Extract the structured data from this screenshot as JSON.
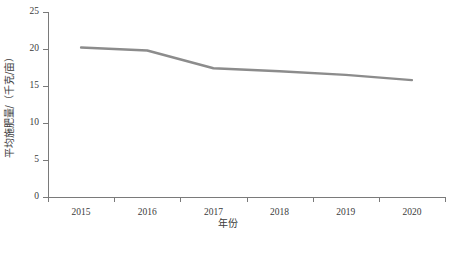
{
  "chart_data": {
    "type": "line",
    "title": "",
    "subtitle": "",
    "xlabel": "年份",
    "ylabel": "平均施肥量/（千克/亩）",
    "categories": [
      "2015",
      "2016",
      "2017",
      "2018",
      "2019",
      "2020"
    ],
    "series": [
      {
        "name": "平均施肥量",
        "color": "#8c8c8c",
        "values": [
          20.2,
          19.8,
          17.4,
          17.0,
          16.5,
          15.8
        ]
      }
    ],
    "x": [
      "2015",
      "2016",
      "2017",
      "2018",
      "2019",
      "2020"
    ],
    "values": [
      20.2,
      19.8,
      17.4,
      17.0,
      16.5,
      15.8
    ],
    "ylim": [
      0,
      25
    ],
    "yticks": [
      "0",
      "5",
      "10",
      "15",
      "20",
      "25"
    ],
    "ytick_values": [
      0,
      5,
      10,
      15,
      20,
      25
    ],
    "xticks": [
      "2015",
      "2016",
      "2017",
      "2018",
      "2019",
      "2020"
    ],
    "grid": false,
    "legend": false,
    "legend_position": "none",
    "markers": false,
    "line_width_px": 2.4,
    "background_color": "#ffffff",
    "axis_color": "#7a7a7a",
    "text_color": "#3b3b3b"
  }
}
